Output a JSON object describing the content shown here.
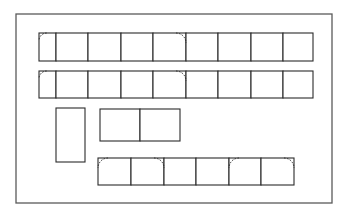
{
  "diagram": {
    "type": "floor-plan",
    "frame": {
      "x": 16,
      "y": 14,
      "w": 316,
      "h": 189,
      "color": "#5a5a5a"
    },
    "line_color": "#2a2a2a",
    "rows": [
      {
        "id": "row-1",
        "y": 33,
        "h": 28,
        "cells_x": [
          39,
          56,
          88,
          121,
          153,
          186,
          218,
          251,
          283,
          313
        ],
        "door_arcs": [
          {
            "cell": 0,
            "corner": "top-left"
          },
          {
            "cell": 4,
            "corner": "top-right"
          }
        ]
      },
      {
        "id": "row-2",
        "y": 71,
        "h": 27,
        "cells_x": [
          39,
          56,
          88,
          121,
          153,
          186,
          218,
          251,
          283,
          313
        ],
        "door_arcs": [
          {
            "cell": 0,
            "corner": "top-left"
          },
          {
            "cell": 4,
            "corner": "top-right"
          }
        ]
      },
      {
        "id": "row-bottom",
        "y": 158,
        "h": 27,
        "cells_x": [
          98,
          131,
          164,
          196,
          229,
          261,
          294
        ],
        "door_arcs": [
          {
            "cell": 0,
            "corner": "top-left"
          },
          {
            "cell": 1,
            "corner": "top-right"
          },
          {
            "cell": 4,
            "corner": "top-left"
          },
          {
            "cell": 5,
            "corner": "top-right"
          }
        ]
      },
      {
        "id": "double-block",
        "y": 109,
        "h": 32,
        "cells_x": [
          100,
          140,
          180
        ],
        "door_arcs": []
      },
      {
        "id": "tall-block",
        "y": 108,
        "h": 54,
        "cells_x": [
          56,
          85
        ],
        "door_arcs": []
      }
    ]
  }
}
